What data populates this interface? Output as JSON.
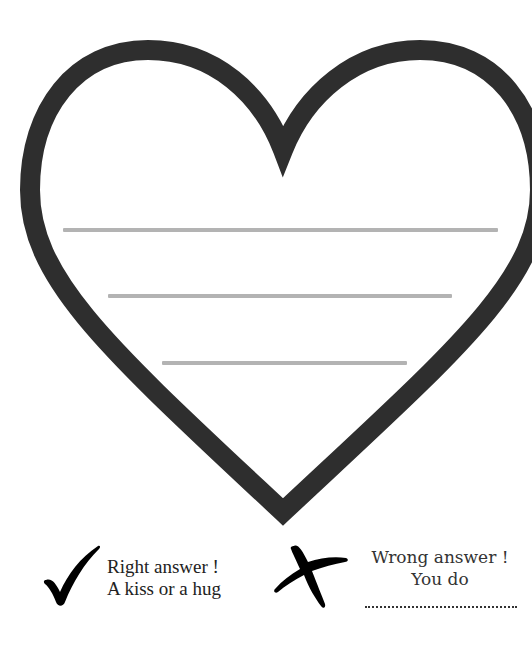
{
  "colors": {
    "heart_stroke": "#2e2e2e",
    "writing_lines": "#b3b3b3",
    "icons": "#000000",
    "text": "#222222"
  },
  "heart": {
    "icon": "heart-outline",
    "writing_lines": [
      {
        "x1": 63,
        "x2": 498,
        "y": 230
      },
      {
        "x1": 108,
        "x2": 452,
        "y": 296
      },
      {
        "x1": 162,
        "x2": 407,
        "y": 363
      }
    ]
  },
  "legend": {
    "right": {
      "icon": "check-mark-icon",
      "line1": "Right answer !",
      "line2": "A kiss or a hug"
    },
    "wrong": {
      "icon": "cross-mark-icon",
      "line1": "Wrong answer !",
      "line2": "You do",
      "blank": "fill-in line"
    }
  }
}
